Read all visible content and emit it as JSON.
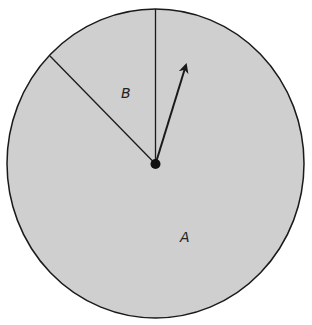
{
  "diagram": {
    "type": "circle-sectors-with-arrow",
    "colors": {
      "fill": "#cfcfcf",
      "stroke": "#1a1a1a",
      "background": "#ffffff"
    },
    "circle": {
      "cx": 155.5,
      "cy": 163.5,
      "rx": 148.5,
      "ry": 154.5
    },
    "center_dot": {
      "x": 155.5,
      "y": 164,
      "r": 5
    },
    "radius_lines": [
      {
        "name": "vertical",
        "x2": 155.5,
        "y2": 9
      },
      {
        "name": "upper-left",
        "x2": 50,
        "y2": 56
      }
    ],
    "arrow": {
      "x2": 186,
      "y2": 65
    },
    "regions": [
      {
        "label": "B",
        "x": 126,
        "y": 98
      },
      {
        "label": "A",
        "x": 185,
        "y": 242
      }
    ]
  }
}
